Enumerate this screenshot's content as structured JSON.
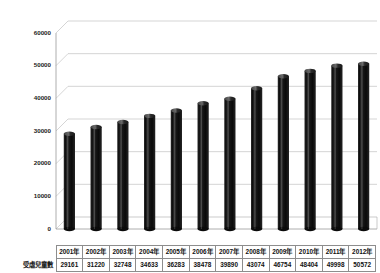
{
  "chart_data": {
    "type": "bar",
    "title": "",
    "subtitle": "",
    "xlabel": "",
    "ylabel": "",
    "categories": [
      "2001年",
      "2002年",
      "2003年",
      "2004年",
      "2005年",
      "2006年",
      "2007年",
      "2008年",
      "2009年",
      "2010年",
      "2011年",
      "2012年"
    ],
    "series": [
      {
        "name": "受虐兒童數",
        "values": [
          29161,
          31220,
          32748,
          34633,
          36283,
          38478,
          39890,
          43074,
          46754,
          48404,
          49998,
          50572
        ]
      }
    ],
    "ylim": [
      0,
      60000
    ],
    "yticks": [
      0,
      10000,
      20000,
      30000,
      40000,
      50000,
      60000
    ],
    "ytick_labels": [
      "0",
      "10000",
      "20000",
      "30000",
      "40000",
      "50000",
      "60000"
    ],
    "grid": true,
    "legend": false,
    "legend_position": "none",
    "bar_style": "cylinder-3d",
    "bar_color": "#111111",
    "gridline_color": "#b9b9b9",
    "background_color": "#ffffff",
    "axis_color": "#9a9a9a"
  },
  "data_table": {
    "row_header": "受虐兒童數",
    "column_headers": [
      "2001年",
      "2002年",
      "2003年",
      "2004年",
      "2005年",
      "2006年",
      "2007年",
      "2008年",
      "2009年",
      "2010年",
      "2011年",
      "2012年"
    ],
    "values": [
      "29161",
      "31220",
      "32748",
      "34633",
      "36283",
      "38478",
      "39890",
      "43074",
      "46754",
      "48404",
      "49998",
      "50572"
    ]
  }
}
